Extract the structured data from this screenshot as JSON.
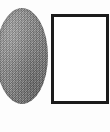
{
  "figure": {
    "caption": "",
    "background_color": "#fdfdfd",
    "width": 110,
    "height": 132,
    "shapes": [
      {
        "name": "circle",
        "label": "",
        "fill": "#8d8d8d",
        "fill_style": "dithered-halftone-gray",
        "outline": "none",
        "clipped_edge": "left",
        "x": -4,
        "y": 8,
        "width": 52,
        "height": 96
      },
      {
        "name": "square",
        "label": "",
        "fill": "#ffffff",
        "fill_style": "solid-white",
        "outline": "#1b1b1b",
        "outline_width": 3,
        "clipped_edge": "right",
        "x": 51,
        "y": 14,
        "width": 58,
        "height": 90
      }
    ]
  },
  "accessibility": {
    "circle_alt": "gray shaded circle",
    "square_alt": "white square with thick black outline"
  }
}
